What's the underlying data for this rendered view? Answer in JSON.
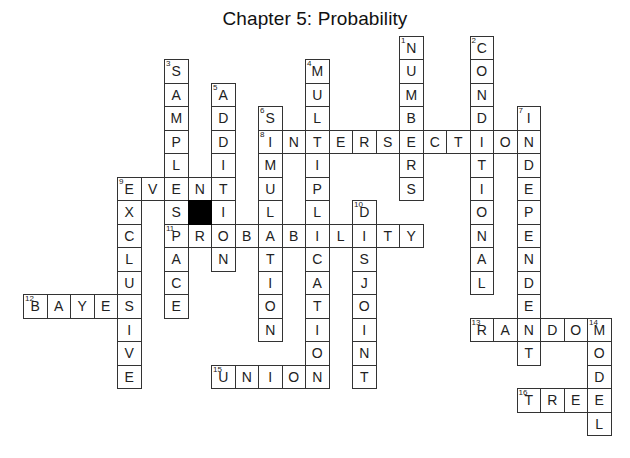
{
  "title": "Chapter 5: Probability",
  "grid": {
    "origin_x": 23,
    "origin_y": 35.5,
    "cell_size": 23.5,
    "cols": 25,
    "rows": 17
  },
  "black_cells": [
    {
      "col": 7,
      "row": 7
    }
  ],
  "words": [
    {
      "number": 1,
      "direction": "down",
      "answer": "NUMBERS",
      "col": 16,
      "row": 0
    },
    {
      "number": 2,
      "direction": "down",
      "answer": "CONDITIONAL",
      "col": 19,
      "row": 0
    },
    {
      "number": 3,
      "direction": "down",
      "answer": "SAMPLESPACE",
      "col": 6,
      "row": 1
    },
    {
      "number": 4,
      "direction": "down",
      "answer": "MULTIPLICATION",
      "col": 12,
      "row": 1
    },
    {
      "number": 5,
      "direction": "down",
      "answer": "ADDITION",
      "col": 8,
      "row": 2
    },
    {
      "number": 6,
      "direction": "down",
      "answer": "SIMULATION",
      "col": 10,
      "row": 3
    },
    {
      "number": 7,
      "direction": "down",
      "answer": "INDEPENDENT",
      "col": 21,
      "row": 3
    },
    {
      "number": 8,
      "direction": "across",
      "answer": "INTERSECTION",
      "col": 10,
      "row": 4
    },
    {
      "number": 9,
      "direction": "across",
      "answer": "EVENT",
      "col": 4,
      "row": 6
    },
    {
      "number": 9,
      "direction": "down",
      "answer": "EXCLUSIVE",
      "col": 4,
      "row": 6
    },
    {
      "number": 10,
      "direction": "down",
      "answer": "DISJOINT",
      "col": 14,
      "row": 7
    },
    {
      "number": 11,
      "direction": "across",
      "answer": "PROBABILITY",
      "col": 6,
      "row": 8
    },
    {
      "number": 12,
      "direction": "across",
      "answer": "BAYES",
      "col": 0,
      "row": 11
    },
    {
      "number": 13,
      "direction": "across",
      "answer": "RANDOM",
      "col": 19,
      "row": 12
    },
    {
      "number": 14,
      "direction": "down",
      "answer": "MODEL",
      "col": 24,
      "row": 12
    },
    {
      "number": 15,
      "direction": "across",
      "answer": "UNION",
      "col": 8,
      "row": 14
    },
    {
      "number": 16,
      "direction": "across",
      "answer": "TREE",
      "col": 21,
      "row": 15
    }
  ]
}
